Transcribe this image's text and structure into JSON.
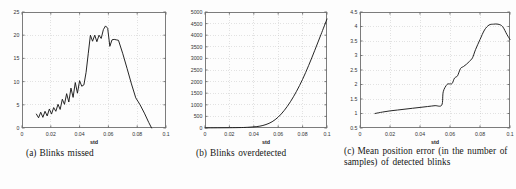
{
  "figure": {
    "background_color": "#fdfdfd",
    "line_color": "#1a1a1a",
    "grid_color": "#c8c8c8",
    "axis_color": "#6e6e6e"
  },
  "captions": {
    "a": {
      "tag": "(a)",
      "text": "Blinks missed"
    },
    "b": {
      "tag": "(b)",
      "text": "Blinks overdetected"
    },
    "c": {
      "tag": "(c)",
      "text": "Mean position error (in the number of samples) of detected blinks"
    }
  },
  "chart_data": [
    {
      "id": "a",
      "type": "line",
      "title": "Blinks missed",
      "xlabel": "std",
      "ylabel": "",
      "xlim": [
        0,
        0.1
      ],
      "ylim": [
        0,
        25
      ],
      "xticks": [
        0,
        0.02,
        0.04,
        0.06,
        0.08,
        0.1
      ],
      "xticklabels": [
        "0",
        "0.02",
        "0.04",
        "0.06",
        "0.08",
        "0.1"
      ],
      "yticks": [
        0,
        5,
        10,
        15,
        20,
        25
      ],
      "yticklabels": [
        "0",
        "5",
        "10",
        "15",
        "20",
        "25"
      ],
      "grid": true,
      "legend": null,
      "x": [
        0.01,
        0.0115,
        0.013,
        0.0145,
        0.016,
        0.0175,
        0.019,
        0.0205,
        0.022,
        0.0235,
        0.025,
        0.0265,
        0.028,
        0.0295,
        0.031,
        0.0325,
        0.034,
        0.0355,
        0.037,
        0.0385,
        0.04,
        0.0415,
        0.043,
        0.0445,
        0.046,
        0.0475,
        0.049,
        0.0505,
        0.052,
        0.0535,
        0.055,
        0.0565,
        0.058,
        0.0595,
        0.061,
        0.0625,
        0.064,
        0.0655,
        0.067,
        0.07,
        0.073,
        0.076,
        0.079,
        0.082,
        0.085,
        0.088,
        0.09
      ],
      "y": [
        3.0,
        2.2,
        3.4,
        2.3,
        3.6,
        2.6,
        4.1,
        3.0,
        4.4,
        3.6,
        5.1,
        4.0,
        6.2,
        5.1,
        7.4,
        5.6,
        8.6,
        6.6,
        9.8,
        7.5,
        10.2,
        9.0,
        9.3,
        12.0,
        16.0,
        20.0,
        18.7,
        20.0,
        18.6,
        20.0,
        19.3,
        21.2,
        22.0,
        21.5,
        17.6,
        19.0,
        19.1,
        19.0,
        18.9,
        16.0,
        12.8,
        9.5,
        6.5,
        5.0,
        3.2,
        1.2,
        0.0
      ]
    },
    {
      "id": "b",
      "type": "line",
      "title": "Blinks overdetected",
      "xlabel": "std",
      "ylabel": "",
      "xlim": [
        0,
        0.1
      ],
      "ylim": [
        0,
        5000
      ],
      "xticks": [
        0,
        0.02,
        0.04,
        0.06,
        0.08,
        0.1
      ],
      "xticklabels": [
        "0",
        "0.02",
        "0.04",
        "0.06",
        "0.08",
        "0.1"
      ],
      "yticks": [
        0,
        500,
        1000,
        1500,
        2000,
        2500,
        3000,
        3500,
        4000,
        4500,
        5000
      ],
      "yticklabels": [
        "0",
        "500",
        "1000",
        "1500",
        "2000",
        "2500",
        "3000",
        "3500",
        "4000",
        "4500",
        "5000"
      ],
      "grid": true,
      "legend": null,
      "x": [
        0.0,
        0.01,
        0.02,
        0.03,
        0.035,
        0.04,
        0.045,
        0.05,
        0.055,
        0.06,
        0.065,
        0.07,
        0.075,
        0.08,
        0.085,
        0.09,
        0.095,
        0.1
      ],
      "y": [
        5,
        8,
        12,
        20,
        30,
        48,
        80,
        150,
        270,
        470,
        760,
        1130,
        1580,
        2100,
        2700,
        3350,
        4020,
        4700
      ]
    },
    {
      "id": "c",
      "type": "line",
      "title": "Mean position error (in the number of samples) of detected blinks",
      "xlabel": "std",
      "ylabel": "",
      "xlim": [
        0,
        0.1
      ],
      "ylim": [
        0.5,
        4.5
      ],
      "xticks": [
        0,
        0.02,
        0.04,
        0.06,
        0.08,
        0.1
      ],
      "xticklabels": [
        "0",
        "0.02",
        "0.04",
        "0.06",
        "0.08",
        "0.1"
      ],
      "yticks": [
        0.5,
        1,
        1.5,
        2,
        2.5,
        3,
        3.5,
        4,
        4.5
      ],
      "yticklabels": [
        "0.5",
        "1",
        "1.5",
        "2",
        "2.5",
        "3",
        "3.5",
        "4",
        "4.5"
      ],
      "grid": true,
      "legend": null,
      "x": [
        0.01,
        0.015,
        0.02,
        0.025,
        0.03,
        0.035,
        0.04,
        0.045,
        0.05,
        0.0545,
        0.0555,
        0.058,
        0.06,
        0.0615,
        0.063,
        0.065,
        0.067,
        0.069,
        0.071,
        0.073,
        0.075,
        0.077,
        0.08,
        0.083,
        0.086,
        0.089,
        0.092,
        0.095,
        0.098,
        0.1
      ],
      "y": [
        1.0,
        1.05,
        1.09,
        1.12,
        1.15,
        1.18,
        1.21,
        1.24,
        1.27,
        1.29,
        1.75,
        2.0,
        2.02,
        2.04,
        2.22,
        2.3,
        2.55,
        2.62,
        2.7,
        2.8,
        2.92,
        3.2,
        3.55,
        3.88,
        4.05,
        4.08,
        4.08,
        4.0,
        3.72,
        3.55
      ]
    }
  ]
}
